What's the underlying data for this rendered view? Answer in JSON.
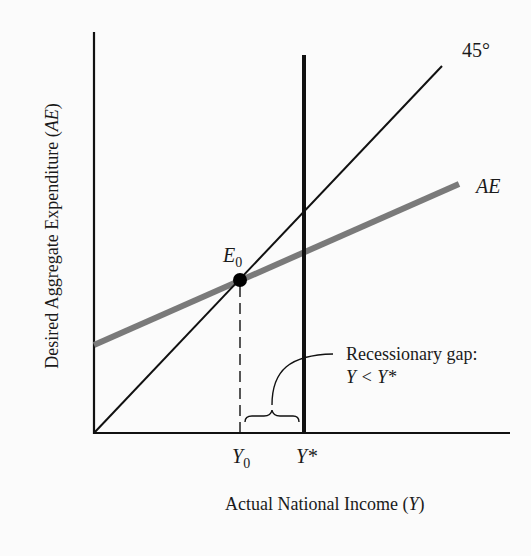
{
  "figure": {
    "y_axis_label": {
      "text": "Desired Aggregate  Expenditure (",
      "italic_part": "AE",
      "close": ")"
    },
    "x_axis_label": {
      "text": "Actual National Income (",
      "italic_part": "Y",
      "close": ")"
    },
    "line_labels": {
      "forty_five": "45°",
      "ae": "AE"
    },
    "equilibrium": {
      "label": "E",
      "subscript": "0"
    },
    "x_ticks": {
      "y0": {
        "label": "Y",
        "subscript": "0"
      },
      "ystar": {
        "label": "Y*"
      }
    },
    "annotation": {
      "line1": "Recessionary gap:",
      "line2": "Y < Y*"
    },
    "colors": {
      "axis": "#111111",
      "forty_five_line": "#111111",
      "ae_line": "#7a7a7a",
      "potential_output_line": "#111111",
      "background": "#fbfbfb"
    }
  }
}
